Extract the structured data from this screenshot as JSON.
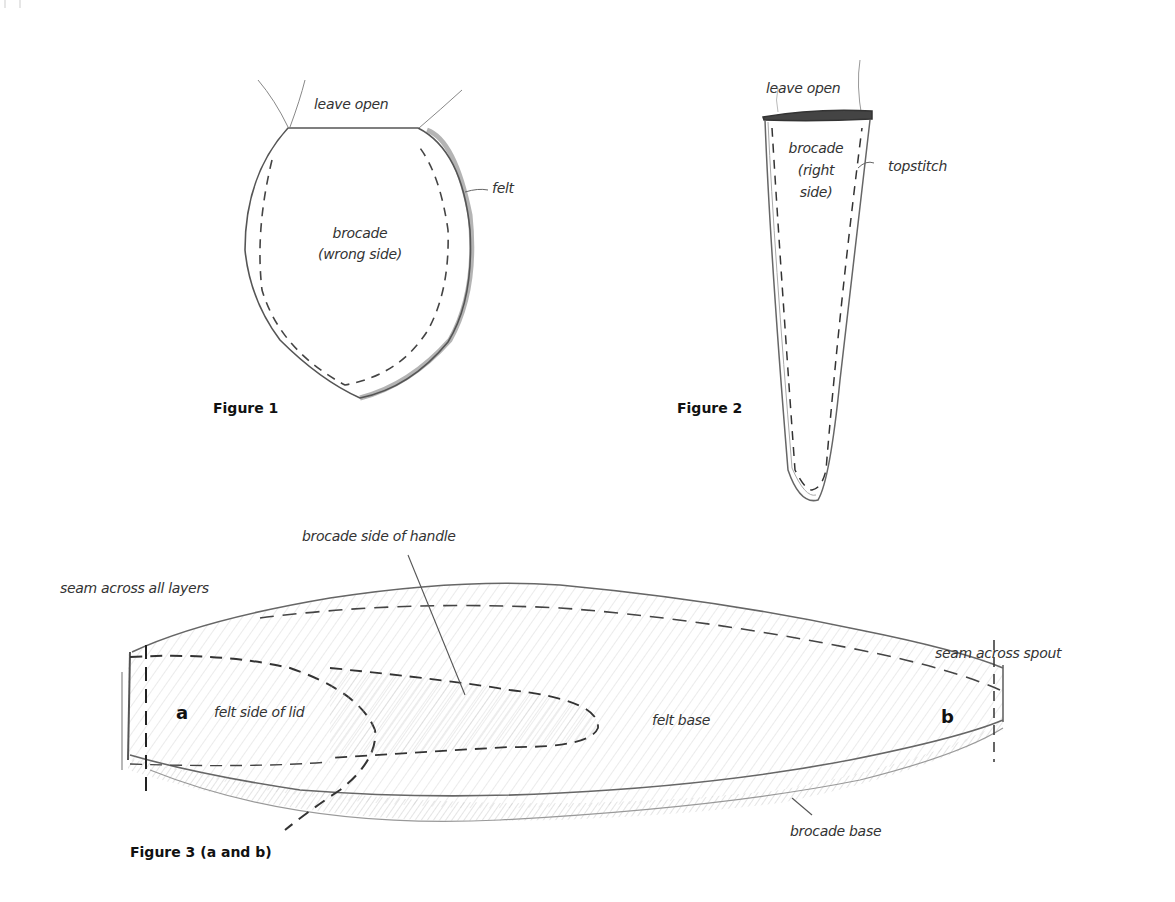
{
  "figure1": {
    "caption": "Figure 1",
    "labels": {
      "leave_open": "leave open",
      "felt": "felt",
      "brocade": "brocade",
      "side": "(wrong side)"
    }
  },
  "figure2": {
    "caption": "Figure 2",
    "labels": {
      "leave_open": "leave open",
      "brocade": "brocade",
      "side_line1": "(right",
      "side_line2": "side)",
      "topstitch": "topstitch"
    }
  },
  "figure3": {
    "caption": "Figure 3 (a and b)",
    "labels": {
      "brocade_side_of_handle": "brocade side of handle",
      "seam_across_all_layers": "seam across all layers",
      "seam_across_spout": "seam across spout",
      "felt_side_of_lid": "felt side of lid",
      "felt_base": "felt base",
      "brocade_base": "brocade base",
      "marker_a": "a",
      "marker_b": "b"
    }
  },
  "colors": {
    "pencil": "#555555",
    "pencil_light": "#999999",
    "stitch": "#333333",
    "background": "#ffffff"
  }
}
